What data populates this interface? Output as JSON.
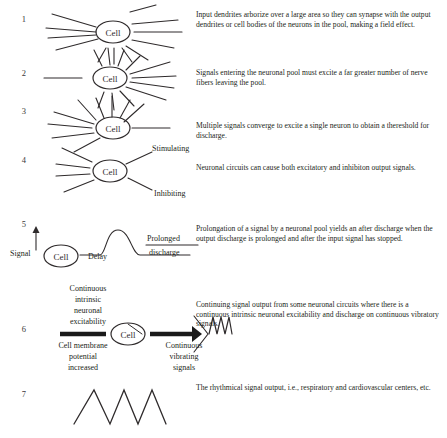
{
  "figure": {
    "cell_label": "Cell",
    "rows": [
      {
        "number": "1",
        "text": "Input dendrites arborize over a large area so they can synapse with the output dendrites or cell bodies of the neurons in the pool, making a field effect.",
        "diagram": "divergence-field-effect"
      },
      {
        "number": "2",
        "text": "Signals entering the neuronal pool must excite a far greater number of nerve fibers leaving the pool.",
        "diagram": "amplifying-divergence"
      },
      {
        "number": "3",
        "text": "Multiple signals converge to excite a single neuron to obtain a thereshold for discharge.",
        "diagram": "convergence"
      },
      {
        "number": "4",
        "text": "Neuronal circuits can cause both excitatory and inhibiton output signals.",
        "diagram": "excitatory-inhibitory",
        "labels": {
          "stimulating": "Stimulating",
          "inhibiting": "Inhibiting"
        }
      },
      {
        "number": "5",
        "text": "Prolongation of a signal by a neuronal pool yields an after discharge when the output discharge is prolonged and after the input signal has stopped.",
        "diagram": "after-discharge",
        "labels": {
          "signal": "Signal",
          "delay": "Delay",
          "prolonged": "Prolonged",
          "discharge": "discharge"
        }
      },
      {
        "number": "6",
        "text": "Continuing signal output from some neuronal circuits where there is a continuous intrinsic neuronal excitability and discharge on continuous vibratory signals.",
        "diagram": "continuous-output",
        "labels": {
          "excitability": "Continuous\nintrinsic\nneuronal\nexcitability",
          "membrane": "Cell membrane\npotential\nincreased",
          "vibrating": "Continuous\nvibrating\nsignals"
        }
      },
      {
        "number": "7",
        "text": "The rhythmical signal output, i.e., respiratory and cardiovascular centers, etc.",
        "diagram": "rhythmical-output"
      }
    ]
  },
  "colors": {
    "ink": "#231f20",
    "stroke": "#2f2b2c",
    "background": "#ffffff"
  }
}
